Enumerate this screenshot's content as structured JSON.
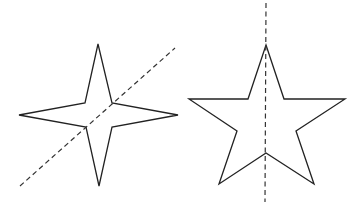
{
  "figure": {
    "width": 356,
    "height": 211,
    "background": "#ffffff",
    "stroke_color": "#222222",
    "shapes": [
      {
        "id": "four-point-star",
        "points": "98,44 112,103 178,115 112,127 99,186 86,127 19,115 85,103",
        "line_of_symmetry": {
          "x1": 20,
          "y1": 186,
          "x2": 175,
          "y2": 48,
          "style": "dashed",
          "orientation": "diagonal"
        }
      },
      {
        "id": "five-point-star",
        "points": "266,45 284,99 345,99 296,131 314,184 266,153 219,184 237,131 189,99 248,99",
        "line_of_symmetry": {
          "x1": 266,
          "y1": 3,
          "x2": 265,
          "y2": 202,
          "style": "dashed",
          "orientation": "vertical"
        }
      }
    ]
  }
}
